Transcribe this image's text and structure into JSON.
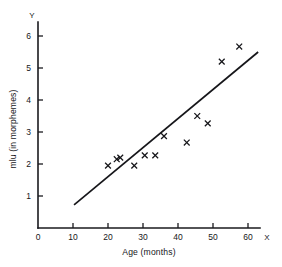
{
  "chart_data": {
    "type": "scatter",
    "title": "",
    "subtitle": "",
    "xlabel": "Age (months)",
    "ylabel": "mlu (in morphemes)",
    "x_axis_letter": "X",
    "y_axis_letter": "Y",
    "xlim": [
      0,
      65
    ],
    "ylim": [
      0,
      6.4
    ],
    "xticks": [
      0,
      10,
      20,
      30,
      40,
      50,
      60
    ],
    "xtick_labels": [
      "0",
      "10",
      "20",
      "30",
      "40",
      "50",
      "60"
    ],
    "yticks": [
      1,
      2,
      3,
      4,
      5,
      6
    ],
    "ytick_labels": [
      "1",
      "2",
      "3",
      "4",
      "5",
      "6"
    ],
    "grid": false,
    "legend": null,
    "marker": "x",
    "series": [
      {
        "name": "children",
        "marker": "x",
        "points": [
          {
            "x": 20.0,
            "y": 1.95
          },
          {
            "x": 22.5,
            "y": 2.15
          },
          {
            "x": 23.5,
            "y": 2.2
          },
          {
            "x": 27.5,
            "y": 1.95
          },
          {
            "x": 30.5,
            "y": 2.27
          },
          {
            "x": 33.5,
            "y": 2.27
          },
          {
            "x": 36.0,
            "y": 2.87
          },
          {
            "x": 42.5,
            "y": 2.67
          },
          {
            "x": 45.5,
            "y": 3.5
          },
          {
            "x": 48.5,
            "y": 3.27
          },
          {
            "x": 52.5,
            "y": 5.2
          },
          {
            "x": 57.5,
            "y": 5.67
          }
        ]
      }
    ],
    "fit_line": {
      "name": "regression-line",
      "x_start": 10.3,
      "y_start": 0.72,
      "x_end": 62.9,
      "y_end": 5.5
    },
    "colors": {
      "axis": "#1a1a1e",
      "marker": "#16161a",
      "fit_line": "#16161a",
      "background": "#ffffff"
    }
  }
}
